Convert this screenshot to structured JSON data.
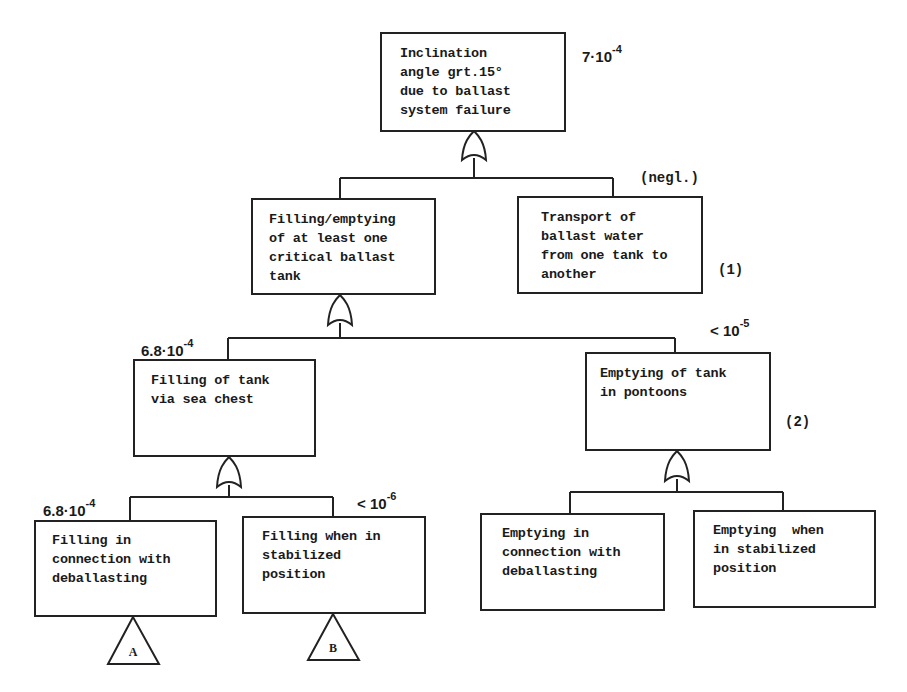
{
  "diagram": {
    "type": "fault-tree",
    "colors": {
      "line": "#222222",
      "text": "#1a1a1a",
      "background": "#ffffff"
    },
    "top_event": {
      "lines": [
        "Inclination",
        "angle grt.15°",
        "due to ballast",
        "system failure"
      ],
      "probability": {
        "base": "7·10",
        "exp": "-4"
      },
      "gate": "OR"
    },
    "level2": [
      {
        "id": "filling-emptying",
        "lines": [
          "Filling/emptying",
          "of at least one",
          "critical ballast",
          "tank"
        ],
        "gate": "OR"
      },
      {
        "id": "transport",
        "lines": [
          "Transport of",
          "ballast water",
          "from one tank to",
          "another"
        ],
        "annotation": "(negl.)",
        "note": "(1)"
      }
    ],
    "level3": [
      {
        "id": "filling-sea-chest",
        "lines": [
          "Filling of tank",
          "via sea chest"
        ],
        "probability": {
          "base": "6.8·10",
          "exp": "-4"
        },
        "gate": "OR"
      },
      {
        "id": "emptying-pontoons",
        "lines": [
          "Emptying of tank",
          "in pontoons"
        ],
        "probability": {
          "base": "< 10",
          "exp": "-5"
        },
        "note": "(2)",
        "gate": "OR"
      }
    ],
    "level4": [
      {
        "id": "filling-deballasting",
        "lines": [
          "Filling in",
          "connection with",
          "deballasting"
        ],
        "probability": {
          "base": "6.8·10",
          "exp": "-4"
        },
        "transfer": "A"
      },
      {
        "id": "filling-stabilized",
        "lines": [
          "Filling when in",
          "stabilized",
          "position"
        ],
        "probability": {
          "base": "< 10",
          "exp": "-6"
        },
        "transfer": "B"
      },
      {
        "id": "emptying-deballasting",
        "lines": [
          "Emptying in",
          "connection with",
          "deballasting"
        ]
      },
      {
        "id": "emptying-stabilized",
        "lines": [
          "Emptying  when",
          "in stabilized",
          "position"
        ]
      }
    ]
  }
}
